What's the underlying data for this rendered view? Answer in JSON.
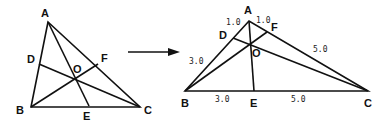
{
  "left_figure": {
    "vertices": {
      "A": "A",
      "B": "B",
      "C": "C"
    },
    "points": {
      "D": "D",
      "E": "E",
      "F": "F",
      "O": "O"
    }
  },
  "arrow": {
    "direction": "right"
  },
  "right_figure": {
    "vertices": {
      "A": "A",
      "B": "B",
      "C": "C"
    },
    "points": {
      "D": "D",
      "E": "E",
      "F": "F",
      "O": "O"
    },
    "lengths": {
      "AD": "1.0",
      "AF": "1.0",
      "DB": "3.0",
      "FC": "5.0",
      "BE": "3.0",
      "EC": "5.0"
    }
  }
}
